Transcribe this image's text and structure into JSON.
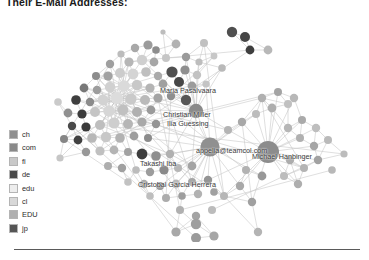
{
  "figure": {
    "title": "Their E-Mail Addresses:"
  },
  "legend": {
    "items": [
      {
        "label": "ch",
        "color": "#8f8f8f"
      },
      {
        "label": "com",
        "color": "#8a8a8a"
      },
      {
        "label": "fi",
        "color": "#c9c9c9"
      },
      {
        "label": "de",
        "color": "#4a4a4a"
      },
      {
        "label": "edu",
        "color": "#ededed"
      },
      {
        "label": "cl",
        "color": "#d8d8d8"
      },
      {
        "label": "EDU",
        "color": "#b0b0b0"
      },
      {
        "label": "jp",
        "color": "#555555"
      }
    ]
  },
  "graph": {
    "type": "node-link-network",
    "edge_color": "#c4c4c4",
    "node_labels": [
      {
        "text": "Maria Pasalvaara",
        "x": 160,
        "y": 77
      },
      {
        "text": "Christian Miller",
        "x": 163,
        "y": 101
      },
      {
        "text": "Ilia Guessing",
        "x": 167,
        "y": 110
      },
      {
        "text": "appelia@teamcol.com",
        "x": 196,
        "y": 137
      },
      {
        "text": "Michael Hanbinger",
        "x": 252,
        "y": 143
      },
      {
        "text": "Takashi Iba",
        "x": 140,
        "y": 150
      },
      {
        "text": "Cristobal Garcia Herrera",
        "x": 138,
        "y": 171
      }
    ],
    "nodes": [
      {
        "x": 163,
        "y": 22,
        "r": 2.6,
        "c": "#bdbdbd"
      },
      {
        "x": 135,
        "y": 38,
        "r": 4.2,
        "c": "#a8a8a8"
      },
      {
        "x": 148,
        "y": 35,
        "r": 4.6,
        "c": "#9b9b9b"
      },
      {
        "x": 156,
        "y": 40,
        "r": 3.8,
        "c": "#8d8d8d"
      },
      {
        "x": 176,
        "y": 34,
        "r": 4.4,
        "c": "#b2b2b2"
      },
      {
        "x": 204,
        "y": 33,
        "r": 4.0,
        "c": "#c0c0c0"
      },
      {
        "x": 232,
        "y": 22,
        "r": 5.2,
        "c": "#4f4f4f"
      },
      {
        "x": 245,
        "y": 27,
        "r": 5.0,
        "c": "#454545"
      },
      {
        "x": 250,
        "y": 40,
        "r": 4.4,
        "c": "#3e3e3e"
      },
      {
        "x": 268,
        "y": 40,
        "r": 4.4,
        "c": "#b8b8b8"
      },
      {
        "x": 121,
        "y": 44,
        "r": 3.6,
        "c": "#bcbcbc"
      },
      {
        "x": 110,
        "y": 54,
        "r": 4.2,
        "c": "#9f9f9f"
      },
      {
        "x": 129,
        "y": 52,
        "r": 4.6,
        "c": "#b6b6b6"
      },
      {
        "x": 142,
        "y": 50,
        "r": 5.2,
        "c": "#cfcfcf"
      },
      {
        "x": 154,
        "y": 52,
        "r": 4.4,
        "c": "#a6a6a6"
      },
      {
        "x": 166,
        "y": 48,
        "r": 4.0,
        "c": "#c6c6c6"
      },
      {
        "x": 186,
        "y": 47,
        "r": 4.2,
        "c": "#9a9a9a"
      },
      {
        "x": 199,
        "y": 52,
        "r": 3.6,
        "c": "#bdbdbd"
      },
      {
        "x": 214,
        "y": 46,
        "r": 3.4,
        "c": "#c7c7c7"
      },
      {
        "x": 96,
        "y": 66,
        "r": 4.0,
        "c": "#8c8c8c"
      },
      {
        "x": 108,
        "y": 66,
        "r": 4.6,
        "c": "#a2a2a2"
      },
      {
        "x": 120,
        "y": 63,
        "r": 5.0,
        "c": "#cccccc"
      },
      {
        "x": 133,
        "y": 64,
        "r": 5.4,
        "c": "#d4d4d4"
      },
      {
        "x": 146,
        "y": 62,
        "r": 4.8,
        "c": "#bfbfbf"
      },
      {
        "x": 158,
        "y": 66,
        "r": 4.2,
        "c": "#a9a9a9"
      },
      {
        "x": 172,
        "y": 62,
        "r": 5.6,
        "c": "#505050"
      },
      {
        "x": 185,
        "y": 60,
        "r": 4.6,
        "c": "#8f8f8f"
      },
      {
        "x": 197,
        "y": 65,
        "r": 4.2,
        "c": "#c2c2c2"
      },
      {
        "x": 222,
        "y": 58,
        "r": 3.8,
        "c": "#b9b9b9"
      },
      {
        "x": 84,
        "y": 78,
        "r": 4.4,
        "c": "#787878"
      },
      {
        "x": 97,
        "y": 80,
        "r": 4.2,
        "c": "#9d9d9d"
      },
      {
        "x": 110,
        "y": 77,
        "r": 5.2,
        "c": "#d0d0d0"
      },
      {
        "x": 124,
        "y": 76,
        "r": 5.8,
        "c": "#dadada"
      },
      {
        "x": 137,
        "y": 75,
        "r": 5.2,
        "c": "#c8c8c8"
      },
      {
        "x": 150,
        "y": 78,
        "r": 4.6,
        "c": "#b4b4b4"
      },
      {
        "x": 163,
        "y": 74,
        "r": 4.4,
        "c": "#a0a0a0"
      },
      {
        "x": 179,
        "y": 72,
        "r": 5.0,
        "c": "#474747"
      },
      {
        "x": 192,
        "y": 76,
        "r": 4.4,
        "c": "#9c9c9c"
      },
      {
        "x": 206,
        "y": 74,
        "r": 3.6,
        "c": "#c4c4c4"
      },
      {
        "x": 76,
        "y": 90,
        "r": 4.8,
        "c": "#3f3f3f"
      },
      {
        "x": 90,
        "y": 92,
        "r": 4.2,
        "c": "#8b8b8b"
      },
      {
        "x": 103,
        "y": 90,
        "r": 5.4,
        "c": "#d2d2d2"
      },
      {
        "x": 117,
        "y": 88,
        "r": 6.0,
        "c": "#dcdcdc"
      },
      {
        "x": 131,
        "y": 89,
        "r": 5.6,
        "c": "#cacaca"
      },
      {
        "x": 145,
        "y": 90,
        "r": 5.0,
        "c": "#bababa"
      },
      {
        "x": 158,
        "y": 88,
        "r": 4.6,
        "c": "#a4a4a4"
      },
      {
        "x": 171,
        "y": 86,
        "r": 4.2,
        "c": "#8e8e8e"
      },
      {
        "x": 186,
        "y": 90,
        "r": 5.2,
        "c": "#565656"
      },
      {
        "x": 68,
        "y": 103,
        "r": 4.4,
        "c": "#909090"
      },
      {
        "x": 82,
        "y": 104,
        "r": 4.6,
        "c": "#3c3c3c"
      },
      {
        "x": 95,
        "y": 102,
        "r": 5.0,
        "c": "#c5c5c5"
      },
      {
        "x": 109,
        "y": 101,
        "r": 5.8,
        "c": "#d6d6d6"
      },
      {
        "x": 123,
        "y": 100,
        "r": 5.4,
        "c": "#c0c0c0"
      },
      {
        "x": 137,
        "y": 102,
        "r": 5.0,
        "c": "#b0b0b0"
      },
      {
        "x": 151,
        "y": 100,
        "r": 4.4,
        "c": "#9a9a9a"
      },
      {
        "x": 196,
        "y": 101,
        "r": 7.2,
        "c": "#8a8a8a"
      },
      {
        "x": 72,
        "y": 116,
        "r": 4.2,
        "c": "#4a4a4a"
      },
      {
        "x": 86,
        "y": 117,
        "r": 4.6,
        "c": "#3a3a3a"
      },
      {
        "x": 100,
        "y": 115,
        "r": 5.0,
        "c": "#bebebe"
      },
      {
        "x": 114,
        "y": 113,
        "r": 5.6,
        "c": "#cecece"
      },
      {
        "x": 128,
        "y": 114,
        "r": 5.0,
        "c": "#b6b6b6"
      },
      {
        "x": 142,
        "y": 112,
        "r": 4.6,
        "c": "#a8a8a8"
      },
      {
        "x": 156,
        "y": 114,
        "r": 4.2,
        "c": "#949494"
      },
      {
        "x": 64,
        "y": 129,
        "r": 4.0,
        "c": "#868686"
      },
      {
        "x": 78,
        "y": 130,
        "r": 4.4,
        "c": "#414141"
      },
      {
        "x": 92,
        "y": 128,
        "r": 4.8,
        "c": "#b8b8b8"
      },
      {
        "x": 106,
        "y": 127,
        "r": 5.2,
        "c": "#c8c8c8"
      },
      {
        "x": 120,
        "y": 128,
        "r": 4.8,
        "c": "#b2b2b2"
      },
      {
        "x": 134,
        "y": 126,
        "r": 4.4,
        "c": "#9e9e9e"
      },
      {
        "x": 148,
        "y": 128,
        "r": 4.0,
        "c": "#8c8c8c"
      },
      {
        "x": 86,
        "y": 142,
        "r": 4.2,
        "c": "#989898"
      },
      {
        "x": 100,
        "y": 141,
        "r": 4.6,
        "c": "#c0c0c0"
      },
      {
        "x": 114,
        "y": 140,
        "r": 4.4,
        "c": "#b4b4b4"
      },
      {
        "x": 128,
        "y": 142,
        "r": 4.0,
        "c": "#a2a2a2"
      },
      {
        "x": 142,
        "y": 144,
        "r": 5.4,
        "c": "#3d3d3d"
      },
      {
        "x": 156,
        "y": 146,
        "r": 4.8,
        "c": "#8e8e8e"
      },
      {
        "x": 170,
        "y": 144,
        "r": 4.2,
        "c": "#b0b0b0"
      },
      {
        "x": 108,
        "y": 156,
        "r": 4.0,
        "c": "#aeaeae"
      },
      {
        "x": 122,
        "y": 158,
        "r": 4.2,
        "c": "#a0a0a0"
      },
      {
        "x": 136,
        "y": 160,
        "r": 3.8,
        "c": "#bcbcbc"
      },
      {
        "x": 150,
        "y": 162,
        "r": 4.2,
        "c": "#9c9c9c"
      },
      {
        "x": 164,
        "y": 160,
        "r": 4.6,
        "c": "#8a8a8a"
      },
      {
        "x": 178,
        "y": 158,
        "r": 4.0,
        "c": "#b6b6b6"
      },
      {
        "x": 192,
        "y": 156,
        "r": 4.4,
        "c": "#a4a4a4"
      },
      {
        "x": 128,
        "y": 172,
        "r": 3.8,
        "c": "#c2c2c2"
      },
      {
        "x": 144,
        "y": 174,
        "r": 4.2,
        "c": "#aaaaaa"
      },
      {
        "x": 160,
        "y": 176,
        "r": 4.0,
        "c": "#989898"
      },
      {
        "x": 176,
        "y": 174,
        "r": 4.4,
        "c": "#b8b8b8"
      },
      {
        "x": 192,
        "y": 172,
        "r": 4.0,
        "c": "#a6a6a6"
      },
      {
        "x": 208,
        "y": 170,
        "r": 4.2,
        "c": "#949494"
      },
      {
        "x": 150,
        "y": 186,
        "r": 3.8,
        "c": "#bebebe"
      },
      {
        "x": 166,
        "y": 188,
        "r": 4.0,
        "c": "#acacac"
      },
      {
        "x": 182,
        "y": 186,
        "r": 3.8,
        "c": "#9e9e9e"
      },
      {
        "x": 198,
        "y": 184,
        "r": 4.2,
        "c": "#b2b2b2"
      },
      {
        "x": 214,
        "y": 182,
        "r": 3.8,
        "c": "#a0a0a0"
      },
      {
        "x": 210,
        "y": 137,
        "r": 9.6,
        "c": "#909090"
      },
      {
        "x": 228,
        "y": 120,
        "r": 4.0,
        "c": "#b4b4b4"
      },
      {
        "x": 242,
        "y": 112,
        "r": 4.2,
        "c": "#a8a8a8"
      },
      {
        "x": 256,
        "y": 104,
        "r": 4.0,
        "c": "#bcbcbc"
      },
      {
        "x": 272,
        "y": 98,
        "r": 4.4,
        "c": "#aeaeae"
      },
      {
        "x": 288,
        "y": 94,
        "r": 4.0,
        "c": "#c0c0c0"
      },
      {
        "x": 262,
        "y": 88,
        "r": 4.2,
        "c": "#b0b0b0"
      },
      {
        "x": 278,
        "y": 82,
        "r": 4.0,
        "c": "#a4a4a4"
      },
      {
        "x": 294,
        "y": 88,
        "r": 4.2,
        "c": "#b8b8b8"
      },
      {
        "x": 268,
        "y": 142,
        "r": 11.0,
        "c": "#8c8c8c"
      },
      {
        "x": 288,
        "y": 118,
        "r": 4.2,
        "c": "#b6b6b6"
      },
      {
        "x": 302,
        "y": 110,
        "r": 4.0,
        "c": "#aaaaaa"
      },
      {
        "x": 316,
        "y": 118,
        "r": 4.2,
        "c": "#bebebe"
      },
      {
        "x": 300,
        "y": 128,
        "r": 4.0,
        "c": "#b0b0b0"
      },
      {
        "x": 314,
        "y": 136,
        "r": 4.2,
        "c": "#a6a6a6"
      },
      {
        "x": 328,
        "y": 130,
        "r": 4.0,
        "c": "#bababa"
      },
      {
        "x": 290,
        "y": 150,
        "r": 4.2,
        "c": "#acacac"
      },
      {
        "x": 304,
        "y": 158,
        "r": 4.0,
        "c": "#b4b4b4"
      },
      {
        "x": 318,
        "y": 150,
        "r": 4.2,
        "c": "#a2a2a2"
      },
      {
        "x": 284,
        "y": 166,
        "r": 4.0,
        "c": "#bcbcbc"
      },
      {
        "x": 298,
        "y": 174,
        "r": 4.2,
        "c": "#aeaeae"
      },
      {
        "x": 262,
        "y": 166,
        "r": 4.4,
        "c": "#989898"
      },
      {
        "x": 246,
        "y": 160,
        "r": 4.0,
        "c": "#b2b2b2"
      },
      {
        "x": 240,
        "y": 176,
        "r": 4.2,
        "c": "#a8a8a8"
      },
      {
        "x": 224,
        "y": 186,
        "r": 4.0,
        "c": "#b6b6b6"
      },
      {
        "x": 252,
        "y": 192,
        "r": 4.2,
        "c": "#a0a0a0"
      },
      {
        "x": 180,
        "y": 200,
        "r": 4.0,
        "c": "#b0b0b0"
      },
      {
        "x": 196,
        "y": 206,
        "r": 4.2,
        "c": "#a4a4a4"
      },
      {
        "x": 212,
        "y": 200,
        "r": 4.0,
        "c": "#bcbcbc"
      },
      {
        "x": 176,
        "y": 222,
        "r": 4.6,
        "c": "#a8a8a8"
      },
      {
        "x": 196,
        "y": 228,
        "r": 5.0,
        "c": "#9a9a9a"
      },
      {
        "x": 214,
        "y": 226,
        "r": 4.6,
        "c": "#a6a6a6"
      },
      {
        "x": 196,
        "y": 214,
        "r": 5.2,
        "c": "#9e9e9e"
      },
      {
        "x": 258,
        "y": 222,
        "r": 4.2,
        "c": "#b4b4b4"
      },
      {
        "x": 332,
        "y": 160,
        "r": 3.8,
        "c": "#b8b8b8"
      },
      {
        "x": 344,
        "y": 144,
        "r": 3.6,
        "c": "#bcbcbc"
      },
      {
        "x": 60,
        "y": 148,
        "r": 3.6,
        "c": "#c6c6c6"
      },
      {
        "x": 58,
        "y": 92,
        "r": 3.8,
        "c": "#cacaca"
      }
    ]
  }
}
